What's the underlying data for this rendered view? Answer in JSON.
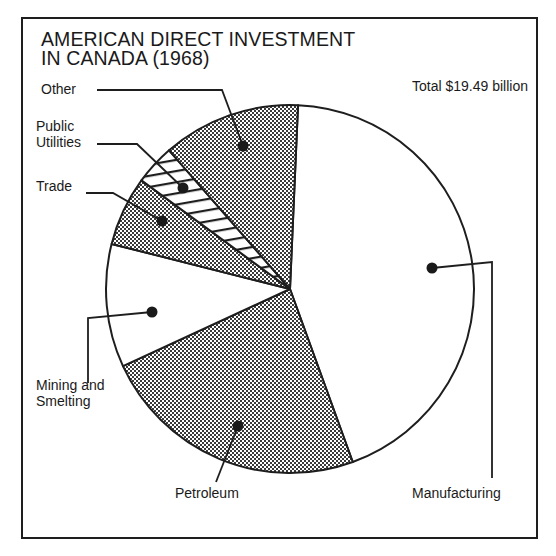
{
  "chart_data": {
    "type": "pie",
    "title": "AMERICAN DIRECT INVESTMENT IN CANADA (1968)",
    "title_lines": [
      "AMERICAN DIRECT INVESTMENT",
      "IN CANADA (1968)"
    ],
    "subtitle": "Total $19.49 billion",
    "total": 19.49,
    "unit": "$ billion",
    "start_angle_deg_clockwise_from_top": 2.5,
    "categories": [
      "Manufacturing",
      "Petroleum",
      "Mining and Smelting",
      "Trade",
      "Public Utilities",
      "Other"
    ],
    "values": [
      8.53,
      4.61,
      2.11,
      1.19,
      0.69,
      2.36
    ],
    "percent": [
      43.8,
      23.7,
      10.8,
      6.1,
      3.5,
      12.1
    ],
    "fills": [
      "white",
      "dotted",
      "white",
      "dotted",
      "hatched",
      "dotted"
    ],
    "legend": "none (callout labels with leader lines)"
  },
  "header": {
    "title_line1": "AMERICAN DIRECT INVESTMENT",
    "title_line2": "IN CANADA (1968)",
    "total": "Total $19.49 billion"
  },
  "labels": {
    "other": "Other",
    "public_utilities_line1": "Public",
    "public_utilities_line2": "Utilities",
    "trade": "Trade",
    "mining_line1": "Mining and",
    "mining_line2": "Smelting",
    "petroleum": "Petroleum",
    "manufacturing": "Manufacturing"
  },
  "colors": {
    "ink": "#1e1e1e",
    "paper": "#ffffff"
  }
}
